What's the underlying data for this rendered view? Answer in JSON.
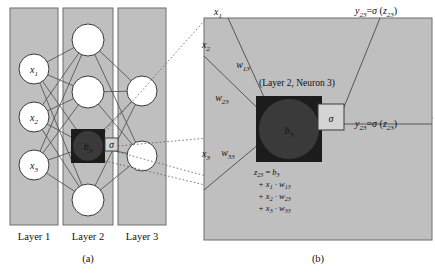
{
  "figure": {
    "panel_a": {
      "caption": "(a)",
      "layer_labels": [
        "Layer 1",
        "Layer 2",
        "Layer 3"
      ],
      "input_nodes": [
        {
          "label": "x",
          "sub": "1"
        },
        {
          "label": "x",
          "sub": "2"
        },
        {
          "label": "x",
          "sub": "3"
        }
      ],
      "hidden_highlight_node": {
        "label": "b",
        "sub": "3"
      },
      "activation_symbol": "σ",
      "hidden_node_count": 4,
      "output_node_count": 2
    },
    "panel_b": {
      "caption": "(b)",
      "neuron_title": "(Layer 2, Neuron 3)",
      "inputs": [
        {
          "label": "x",
          "sub": "1"
        },
        {
          "label": "x",
          "sub": "2"
        },
        {
          "label": "x",
          "sub": "3"
        }
      ],
      "weights": [
        {
          "label": "w",
          "sub": "13"
        },
        {
          "label": "w",
          "sub": "23"
        },
        {
          "label": "w",
          "sub": "33"
        }
      ],
      "bias_node": {
        "label": "b",
        "sub": "3"
      },
      "activation_symbol": "σ",
      "outputs": [
        {
          "var": "y",
          "var_sub": "23",
          "eq": "=",
          "fn": "σ",
          "arg": "z",
          "arg_sub": "23"
        },
        {
          "var": "y",
          "var_sub": "23",
          "eq": "=",
          "fn": "σ",
          "arg": "z",
          "arg_sub": "23"
        }
      ],
      "formula": {
        "line1_lhs": "z",
        "line1_lhs_sub": "23",
        "line1_eq": "=",
        "line1_rhs": "b",
        "line1_rhs_sub": "3",
        "line2": "+ x",
        "line2_sub1": "1",
        "line2_mid": " · w",
        "line2_sub2": "13",
        "line3": "+ x",
        "line3_sub1": "2",
        "line3_mid": " · w",
        "line3_sub2": "23",
        "line4": "+ x",
        "line4_sub1": "3",
        "line4_mid": " · w",
        "line4_sub2": "33"
      }
    },
    "colors": {
      "panel_fill": "#bfbfbf",
      "panel_stroke": "#6e6e6e",
      "node_fill": "#ffffff",
      "node_stroke": "#3a3a3a",
      "dark_node_fill": "#3a3a3a",
      "dark_square_fill": "#1c1c1c",
      "edge_stroke": "#4a4a4a",
      "guide_stroke": "#5a5a5a",
      "text": "#111111"
    }
  }
}
